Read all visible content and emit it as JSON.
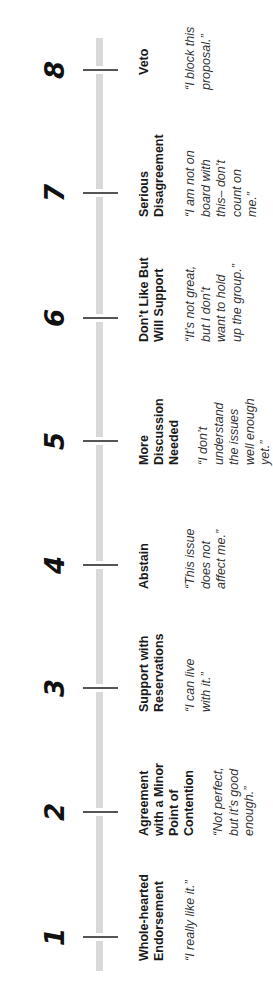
{
  "diagram": {
    "type": "scale",
    "orientation": "rotated -90deg",
    "bar_color": "#d9d9d9",
    "tick_color": "#555555",
    "points": [
      {
        "number": "1",
        "label": "Whole-hearted Endorsement",
        "quote": "“I really like it.”"
      },
      {
        "number": "2",
        "label": "Agreement with a Minor Point of Contention",
        "quote": "“Not perfect, but it’s good enough.”"
      },
      {
        "number": "3",
        "label": "Support with Reservations",
        "quote": "“I can live with it.”"
      },
      {
        "number": "4",
        "label": "Abstain",
        "quote": "“This issue does not affect me.”"
      },
      {
        "number": "5",
        "label": "More Discussion Needed",
        "quote": "“I don’t understand the issues well enough yet.”"
      },
      {
        "number": "6",
        "label": "Don’t Like But Will Support",
        "quote": "“It’s not great, but I don’t want to hold up the group.”"
      },
      {
        "number": "7",
        "label": "Serious Disagreement",
        "quote": "“I am not on board with this– don’t count on me.”"
      },
      {
        "number": "8",
        "label": "Veto",
        "quote": "“I block this proposal.”"
      }
    ]
  }
}
